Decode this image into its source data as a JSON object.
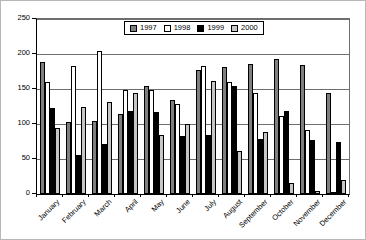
{
  "chart_data": {
    "type": "bar",
    "title": "",
    "xlabel": "",
    "ylabel": "",
    "categories": [
      "January",
      "February",
      "March",
      "April",
      "May",
      "June",
      "July",
      "August",
      "September",
      "October",
      "November",
      "December"
    ],
    "series": [
      {
        "name": "1997",
        "color": "#7f7f7f",
        "values": [
          188,
          103,
          105,
          114,
          155,
          135,
          177,
          182,
          186,
          193,
          184,
          145
        ]
      },
      {
        "name": "1998",
        "color": "#ffffff",
        "values": [
          160,
          183,
          205,
          148,
          148,
          129,
          183,
          160,
          144,
          112,
          92,
          3
        ]
      },
      {
        "name": "1999",
        "color": "#000000",
        "values": [
          123,
          56,
          72,
          119,
          117,
          83,
          85,
          155,
          79,
          118,
          77,
          74
        ]
      },
      {
        "name": "2000",
        "color": "#c6c6c6",
        "values": [
          95,
          125,
          132,
          145,
          84,
          100,
          161,
          62,
          88,
          16,
          5,
          20
        ]
      }
    ],
    "ylim": [
      0,
      250
    ],
    "yticks": [
      0,
      50,
      100,
      150,
      200,
      250
    ],
    "grid": true,
    "legend_position": "top-center",
    "bar_outline_color": "#000000",
    "gridline_color": "#6e6e6e"
  }
}
